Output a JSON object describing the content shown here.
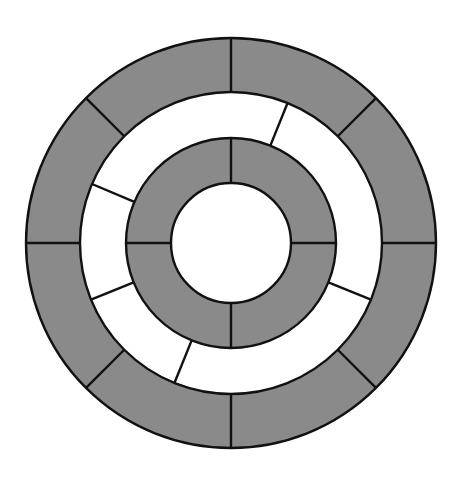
{
  "diagram": {
    "title": "",
    "type": "concentric-segmented-rings",
    "canvas": {
      "width": 462,
      "height": 484
    },
    "center": {
      "x": 231,
      "y": 243
    },
    "colors": {
      "background": "#ffffff",
      "gray_fill": "#8a8a8a",
      "white_fill": "#ffffff",
      "stroke": "#111111"
    },
    "stroke_width": 2.4,
    "rings": [
      {
        "name": "outer-ring",
        "inner_radius": 151,
        "outer_radius": 205,
        "fill": "gray",
        "segment_count": 8,
        "divider_angles_deg": [
          0,
          45,
          90,
          135,
          180,
          225,
          270,
          315
        ]
      },
      {
        "name": "middle-ring",
        "inner_radius": 105,
        "outer_radius": 151,
        "fill": "white",
        "segment_count": 5,
        "divider_angles_deg": [
          68,
          157,
          202,
          248,
          338
        ]
      },
      {
        "name": "inner-ring",
        "inner_radius": 60,
        "outer_radius": 105,
        "fill": "gray",
        "segment_count": 4,
        "divider_angles_deg": [
          0,
          90,
          180,
          270
        ]
      }
    ],
    "core": {
      "name": "center-disc",
      "radius": 60,
      "fill": "white"
    }
  }
}
